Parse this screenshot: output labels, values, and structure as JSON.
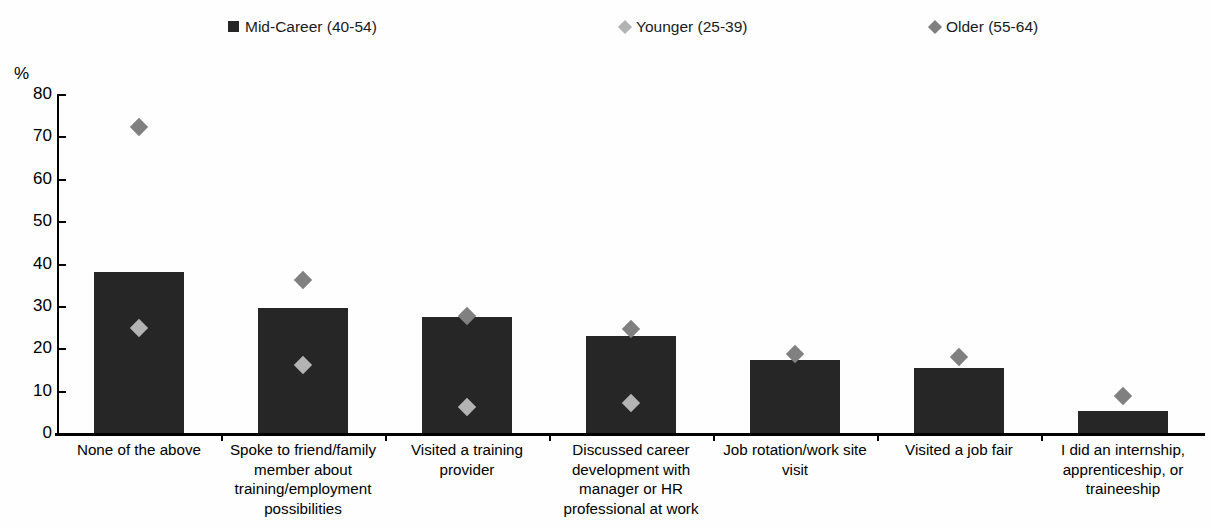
{
  "chart_data": {
    "type": "bar",
    "title": "",
    "subtitle": "",
    "xlabel": "",
    "ylabel": "%",
    "ylim": [
      0,
      80
    ],
    "yticks": [
      0,
      10,
      20,
      30,
      40,
      50,
      60,
      70,
      80
    ],
    "grid": false,
    "legend_position": "top",
    "categories": [
      "None of the above",
      "Spoke to friend/family member about training/employment possibilities",
      "Visited a training provider",
      "Discussed career development with manager or HR professional at work",
      "Job rotation/work site visit",
      "Visited a job fair",
      "I did an internship, apprenticeship, or traineeship"
    ],
    "series": [
      {
        "name": "Mid-Career (40-54)",
        "type": "bar",
        "marker": "square",
        "color": "#262626",
        "values": [
          38.0,
          29.5,
          27.4,
          22.9,
          17.3,
          15.3,
          5.3
        ]
      },
      {
        "name": "Younger (25-39)",
        "type": "marker",
        "marker": "diamond",
        "color": "#b3b3b3",
        "values": [
          24.8,
          16.0,
          6.1,
          7.0,
          null,
          null,
          null
        ]
      },
      {
        "name": "Older (55-64)",
        "type": "marker",
        "marker": "diamond",
        "color": "#808080",
        "values": [
          72.2,
          36.2,
          27.6,
          24.6,
          18.6,
          17.9,
          8.8
        ]
      }
    ]
  },
  "legend": {
    "items": [
      {
        "label": "Mid-Career (40-54)",
        "marker": "square",
        "color": "#262626"
      },
      {
        "label": "Younger (25-39)",
        "marker": "diamond",
        "color": "#b3b3b3"
      },
      {
        "label": "Older (55-64)",
        "marker": "diamond",
        "color": "#808080"
      }
    ]
  },
  "axis": {
    "y_unit_label": "%",
    "y_tick_labels": [
      "80",
      "70",
      "60",
      "50",
      "40",
      "30",
      "20",
      "10",
      "0"
    ]
  },
  "category_labels": [
    "None of the above",
    "Spoke to friend/family member about training/employment possibilities",
    "Visited a training provider",
    "Discussed career development with manager or HR professional at work",
    "Job rotation/work site visit",
    "Visited a job fair",
    "I did an internship, apprenticeship, or traineeship"
  ]
}
